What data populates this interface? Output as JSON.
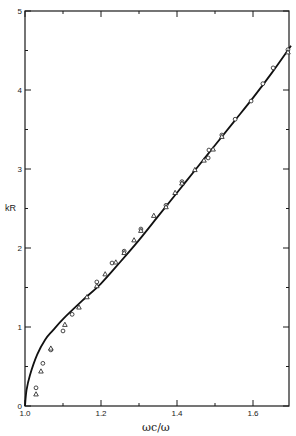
{
  "chart_data": {
    "type": "scatter",
    "title": "",
    "xlabel": "ωc/ω",
    "ylabel": "kR",
    "xlim": [
      1.0,
      1.7
    ],
    "ylim": [
      0,
      5
    ],
    "grid": false,
    "legend": null,
    "x_ticks": [
      {
        "value": 1.0,
        "label": "1.0"
      },
      {
        "value": 1.2,
        "label": "1.2"
      },
      {
        "value": 1.4,
        "label": "1.4"
      },
      {
        "value": 1.6,
        "label": "1.6"
      }
    ],
    "x_minor_ticks": [
      1.1,
      1.3,
      1.5
    ],
    "y_ticks": [
      {
        "value": 0,
        "label": "0"
      },
      {
        "value": 1,
        "label": "1"
      },
      {
        "value": 2,
        "label": "2"
      },
      {
        "value": 3,
        "label": "3"
      },
      {
        "value": 4,
        "label": "4"
      },
      {
        "value": 5,
        "label": "5"
      }
    ],
    "y_minor_ticks": [
      0.5,
      1.5,
      2.5,
      3.5,
      4.5
    ],
    "series": [
      {
        "name": "theory",
        "kind": "line",
        "color": "#111111",
        "x": [
          1.0,
          1.004,
          1.013,
          1.032,
          1.053,
          1.074,
          1.1,
          1.15,
          1.2,
          1.25,
          1.3,
          1.35,
          1.4,
          1.45,
          1.5,
          1.55,
          1.6,
          1.65,
          1.7
        ],
        "y": [
          0.0,
          0.2,
          0.39,
          0.65,
          0.84,
          0.96,
          1.1,
          1.33,
          1.55,
          1.82,
          2.1,
          2.4,
          2.7,
          3.0,
          3.3,
          3.6,
          3.9,
          4.22,
          4.56
        ]
      },
      {
        "name": "circles",
        "kind": "marker",
        "marker": "circle",
        "x": [
          1.029,
          1.047,
          1.068,
          1.1,
          1.124,
          1.189,
          1.229,
          1.261,
          1.305,
          1.371,
          1.413,
          1.482,
          1.484,
          1.518,
          1.553,
          1.595,
          1.626,
          1.653,
          1.692
        ],
        "y": [
          0.23,
          0.54,
          0.71,
          0.95,
          1.16,
          1.57,
          1.81,
          1.96,
          2.24,
          2.54,
          2.84,
          3.14,
          3.24,
          3.43,
          3.63,
          3.86,
          4.08,
          4.28,
          4.51
        ]
      },
      {
        "name": "triangles",
        "kind": "marker",
        "marker": "triangle",
        "x": [
          1.029,
          1.042,
          1.068,
          1.105,
          1.142,
          1.163,
          1.189,
          1.211,
          1.239,
          1.261,
          1.287,
          1.305,
          1.339,
          1.371,
          1.395,
          1.413,
          1.447,
          1.471,
          1.495,
          1.518,
          1.692
        ],
        "y": [
          0.15,
          0.44,
          0.73,
          1.03,
          1.25,
          1.38,
          1.52,
          1.67,
          1.82,
          1.94,
          2.1,
          2.22,
          2.41,
          2.52,
          2.7,
          2.82,
          2.99,
          3.11,
          3.25,
          3.41,
          4.48
        ]
      }
    ]
  },
  "layout": {
    "plot_left": 25,
    "plot_right": 289,
    "plot_top": 11,
    "plot_bottom": 406,
    "px_per_x_unit": 380,
    "px_per_y_unit": 79
  }
}
